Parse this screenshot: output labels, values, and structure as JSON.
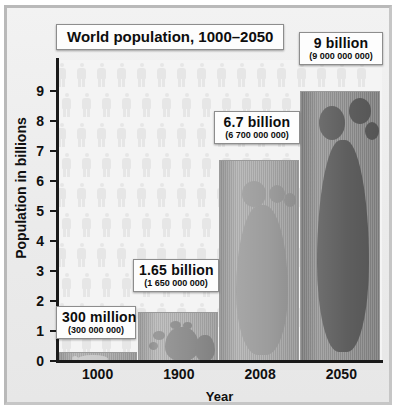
{
  "chart_data": {
    "type": "bar",
    "title": "World population, 1000–2050",
    "xlabel": "Year",
    "ylabel": "Population in billions",
    "categories": [
      "1000",
      "1900",
      "2008",
      "2050"
    ],
    "values": [
      0.3,
      1.65,
      6.7,
      9
    ],
    "ylim": [
      0,
      9.6
    ],
    "yticks": [
      "0",
      "1",
      "2",
      "3",
      "4",
      "5",
      "6",
      "7",
      "8",
      "9"
    ],
    "grid": false,
    "legend": "none",
    "annotations": [
      {
        "value_label": "300 million",
        "exact": "(300 000 000)",
        "category": "1000"
      },
      {
        "value_label": "1.65 billion",
        "exact": "(1 650 000 000)",
        "category": "1900"
      },
      {
        "value_label": "6.7 billion",
        "exact": "(6 700 000 000)",
        "category": "2008"
      },
      {
        "value_label": "9 billion",
        "exact": "(9 000 000 000)",
        "category": "2050"
      }
    ],
    "bar_colors": [
      "#a8a8a8",
      "#b0b0b0",
      "#a9a9a9",
      "#8e8e8e"
    ],
    "background_motif": "human-figure-pictograms",
    "bar_motif": "footprints"
  },
  "colors": {
    "frame": "#b9b9b9",
    "plot_background": "#f4f4f4",
    "axis": "#1a1a1a",
    "callout_background": "#fdfdfd",
    "text": "#0d0d0d"
  }
}
